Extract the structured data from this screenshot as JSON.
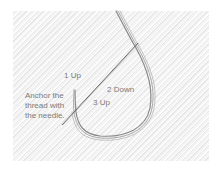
{
  "labels": {
    "step1": "1 Up",
    "step2": "2 Down",
    "step3": "3 Up",
    "anchor": "Anchor the thread with the needle."
  },
  "colors": {
    "background": "#ffffff",
    "fabric": "#f1f1f1",
    "thread": "#8a8a8a",
    "needle": "#6a6a6a",
    "label_text": "#7a7a7a"
  }
}
